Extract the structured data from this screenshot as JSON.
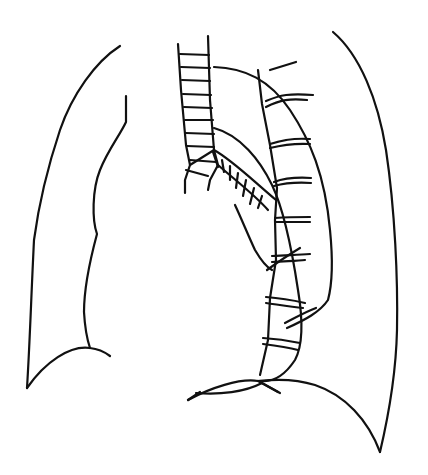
{
  "figure": {
    "type": "line-drawing",
    "background": "#ffffff",
    "stroke_color": "#111111",
    "stroke_width": 2.2,
    "width": 428,
    "height": 475
  },
  "shapes": {
    "right_lung_outer": "M120 46 C95 62 72 95 60 130 C45 175 38 210 34 240 C31 300 30 340 27 388",
    "right_lung_base": "M27 388 C45 362 70 345 90 348 C100 349 106 353 110 356",
    "right_lung_inner": "M126 96 L126 122 C120 135 108 150 100 170 C92 190 92 220 97 234 C90 260 84 290 84 312 C85 330 88 342 90 348",
    "left_lung_outer": "M333 32 C360 55 378 100 386 150 C395 210 398 280 397 330 C396 375 388 418 380 452",
    "left_lung_base": "M380 452 C368 420 345 395 315 385 C290 377 268 380 258 381",
    "diaphragm_left": "M188 400 C210 388 240 378 258 381",
    "diaphragm_right": "M196 393 C220 395 245 392 262 383 L280 393",
    "trachea_left": "M178 44 L181 90 L186 145 L190 165 L185 180 L185 193",
    "trachea_right": "M208 36 L210 100 L214 150 L218 165 L210 180 L208 190",
    "bronchus_lower": "M218 165 C235 180 255 195 268 210",
    "bronchus_upper": "M190 165 L214 150 C232 160 250 178 276 200",
    "aortic_arch": "M214 67 C245 68 270 80 290 110 C310 140 325 175 330 230 C333 260 332 285 328 300 C320 312 305 320 287 328",
    "descending_aorta_inner": "M214 128 C240 135 260 160 272 185 C284 210 292 250 298 290 C303 320 303 345 295 360 C285 375 275 382 262 381",
    "aorta_lower_branch": "M235 205 C242 220 248 235 255 250 C262 262 268 268 272 270",
    "spine_left": "M258 70 L262 104 L270 145 L277 188 L275 220 L276 260 L270 298 L268 340 L260 375",
    "spine_right_stub": "M270 70 L296 62",
    "vertebra_lines": [
      "M266 101 C280 95 290 93 313 95",
      "M266 107 C280 100 290 98 307 100",
      "M270 144 C282 140 292 138 310 139",
      "M270 148 C282 145 292 143 310 144",
      "M274 182 C285 178 295 177 311 178",
      "M274 186 C285 183 295 182 311 183",
      "M275 218 C288 217 298 217 310 217",
      "M275 222 C288 222 298 222 310 222",
      "M272 256 C288 255 298 255 310 254",
      "M272 262 C288 261 298 261 305 260",
      "M266 297 C280 298 292 300 305 303",
      "M266 303 C280 305 292 307 303 308",
      "M263 338 C278 339 290 341 300 343",
      "M263 344 C278 346 290 348 298 350"
    ],
    "trachea_rings": [
      "M180 54 L209 55",
      "M181 67 L210 68",
      "M182 80 L210 81",
      "M183 94 L211 95",
      "M184 107 L212 108",
      "M185 120 L213 120",
      "M186 133 L214 134",
      "M187 146 L214 147",
      "M190 160 L216 162"
    ],
    "bronchus_rings": [
      "M186 170 L208 176",
      "M213 152 L218 167",
      "M222 160 L224 172",
      "M230 166 L230 180",
      "M238 173 L236 188",
      "M246 180 L243 196",
      "M254 188 L250 204",
      "M262 196 L258 208"
    ],
    "crossing_strokes": [
      "M267 270 C278 262 290 254 300 248",
      "M285 323 C295 318 305 312 316 308",
      "M188 400 L200 392",
      "M258 381 L278 392"
    ]
  },
  "labels": []
}
